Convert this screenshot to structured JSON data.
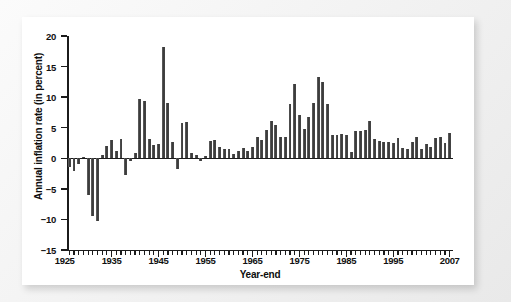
{
  "figure": {
    "background_color": "#f1f1f1",
    "panel_color": "#ffffff",
    "bar_color": "#444444",
    "axis_color": "#1b1b1b"
  },
  "chart_data": {
    "type": "bar",
    "title": "",
    "xlabel": "Year-end",
    "ylabel": "Annual inflation rate (in percent)",
    "ylim": [
      -15,
      20
    ],
    "yticks": [
      -15,
      -10,
      -5,
      0,
      5,
      10,
      15,
      20
    ],
    "ytick_labels": [
      "−15",
      "−10",
      "−5",
      "0",
      "5",
      "10",
      "15",
      "20"
    ],
    "xlim": [
      1925.5,
      2007.5
    ],
    "xticks": [
      1925,
      1935,
      1945,
      1955,
      1965,
      1975,
      1985,
      1995,
      2007
    ],
    "xtick_labels": [
      "1925",
      "1935",
      "1945",
      "1955",
      "1965",
      "1975",
      "1985",
      "1995",
      "2007"
    ],
    "minor_xtick_interval": 1,
    "grid": false,
    "legend": null,
    "categories": [
      1926,
      1927,
      1928,
      1929,
      1930,
      1931,
      1932,
      1933,
      1934,
      1935,
      1936,
      1937,
      1938,
      1939,
      1940,
      1941,
      1942,
      1943,
      1944,
      1945,
      1946,
      1947,
      1948,
      1949,
      1950,
      1951,
      1952,
      1953,
      1954,
      1955,
      1956,
      1957,
      1958,
      1959,
      1960,
      1961,
      1962,
      1963,
      1964,
      1965,
      1966,
      1967,
      1968,
      1969,
      1970,
      1971,
      1972,
      1973,
      1974,
      1975,
      1976,
      1977,
      1978,
      1979,
      1980,
      1981,
      1982,
      1983,
      1984,
      1985,
      1986,
      1987,
      1988,
      1989,
      1990,
      1991,
      1992,
      1993,
      1994,
      1995,
      1996,
      1997,
      1998,
      1999,
      2000,
      2001,
      2002,
      2003,
      2004,
      2005,
      2006,
      2007
    ],
    "values": [
      -1.5,
      -2.1,
      -1.0,
      0.2,
      -6.0,
      -9.5,
      -10.3,
      0.5,
      2.0,
      3.0,
      1.2,
      3.1,
      -2.8,
      -0.5,
      0.9,
      9.7,
      9.3,
      3.2,
      2.1,
      2.3,
      18.2,
      9.0,
      2.7,
      -1.8,
      5.8,
      5.9,
      0.9,
      0.6,
      -0.5,
      0.4,
      2.9,
      3.0,
      1.8,
      1.5,
      1.5,
      0.7,
      1.2,
      1.7,
      1.2,
      1.9,
      3.4,
      3.0,
      4.7,
      6.1,
      5.5,
      3.4,
      3.4,
      8.8,
      12.2,
      7.0,
      4.8,
      6.8,
      9.0,
      13.3,
      12.4,
      8.9,
      3.8,
      3.8,
      3.9,
      3.8,
      1.1,
      4.4,
      4.4,
      4.6,
      6.1,
      3.1,
      2.9,
      2.7,
      2.7,
      2.5,
      3.3,
      1.7,
      1.6,
      2.7,
      3.4,
      1.6,
      2.4,
      1.9,
      3.3,
      3.4,
      2.5,
      4.1
    ]
  }
}
